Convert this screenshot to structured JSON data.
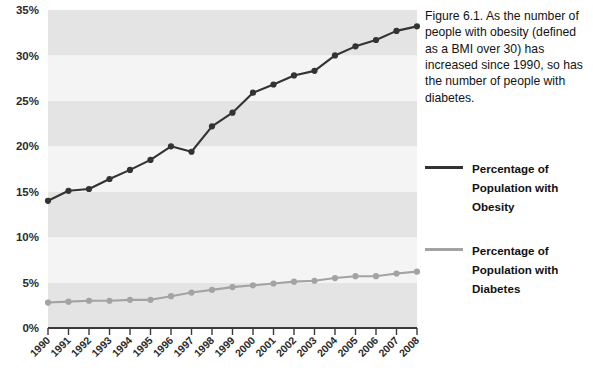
{
  "figure": {
    "caption": "Figure 6.1. As the number of people with obesity (defined as a BMI over 30) has increased since 1990, so has the number of people with diabetes."
  },
  "legend": {
    "items": [
      {
        "label": "Percentage of Population with Obesity",
        "color": "#333333",
        "name": "legend-item-obesity"
      },
      {
        "label": "Percentage of Population with Diabetes",
        "color": "#a3a3a3",
        "name": "legend-item-diabetes"
      }
    ]
  },
  "colors": {
    "obesity_line": "#333333",
    "diabetes_line": "#a3a3a3",
    "band_light": "#f4f4f4",
    "band_dark": "#e4e4e4",
    "axis": "#3a3a3a",
    "text": "#2b2b2b"
  },
  "chart_data": {
    "type": "line",
    "title": "",
    "xlabel": "",
    "ylabel": "",
    "ylim": [
      0,
      35
    ],
    "yticks": [
      0,
      5,
      10,
      15,
      20,
      25,
      30,
      35
    ],
    "ytick_labels": [
      "0%",
      "5%",
      "10%",
      "15%",
      "20%",
      "25%",
      "30%",
      "35%"
    ],
    "grid": false,
    "banded_background": true,
    "legend_position": "right",
    "x_tick_rotation": -45,
    "categories": [
      "1990",
      "1991",
      "1992",
      "1993",
      "1994",
      "1995",
      "1996",
      "1997",
      "1998",
      "1999",
      "2000",
      "2001",
      "2002",
      "2003",
      "2004",
      "2005",
      "2006",
      "2007",
      "2008"
    ],
    "series": [
      {
        "name": "Percentage of Population with Obesity",
        "color": "#333333",
        "marker": "circle",
        "values": [
          14.0,
          15.1,
          15.3,
          16.4,
          17.4,
          18.5,
          20.0,
          19.4,
          22.2,
          23.7,
          25.9,
          26.8,
          27.8,
          28.3,
          30.0,
          31.0,
          31.7,
          32.7,
          33.2
        ]
      },
      {
        "name": "Percentage of Population with Diabetes",
        "color": "#a3a3a3",
        "marker": "circle",
        "values": [
          2.8,
          2.9,
          3.0,
          3.0,
          3.1,
          3.1,
          3.5,
          3.9,
          4.2,
          4.5,
          4.7,
          4.9,
          5.1,
          5.2,
          5.5,
          5.7,
          5.7,
          6.0,
          6.2
        ]
      }
    ]
  }
}
